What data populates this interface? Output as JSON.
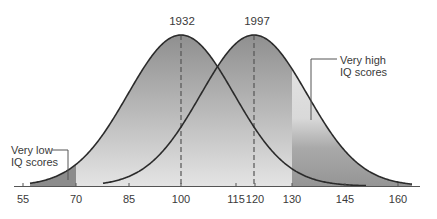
{
  "chart_data": {
    "type": "area",
    "title": "",
    "xlabel": "",
    "ylabel": "",
    "x_ticks": [
      55,
      70,
      85,
      100,
      115,
      120,
      130,
      145,
      160
    ],
    "xlim": [
      53,
      163
    ],
    "grid": false,
    "series": [
      {
        "name": "1932",
        "mean": 100,
        "sd": 15,
        "label": "1932"
      },
      {
        "name": "1997",
        "mean": 120,
        "sd": 15,
        "label": "1997"
      }
    ],
    "annotations": [
      {
        "text_lines": [
          "Very low",
          "IQ scores"
        ],
        "region": "below 70"
      },
      {
        "text_lines": [
          "Very high",
          "IQ scores"
        ],
        "region": "above 130"
      }
    ],
    "thresholds": [
      70,
      130
    ],
    "colors": {
      "curve": "#2b2b2b",
      "fill_dark": "#8e8e8e",
      "fill_light": "#e6e6e6",
      "tail_dark": "#8a8a8a",
      "axis": "#555555",
      "dashed": "#555555"
    }
  },
  "labels": {
    "year_left": "1932",
    "year_right": "1997",
    "low_line1": "Very low",
    "low_line2": "IQ scores",
    "high_line1": "Very high",
    "high_line2": "IQ scores",
    "ticks": [
      "55",
      "70",
      "85",
      "100",
      "115",
      "120",
      "130",
      "145",
      "160"
    ]
  }
}
